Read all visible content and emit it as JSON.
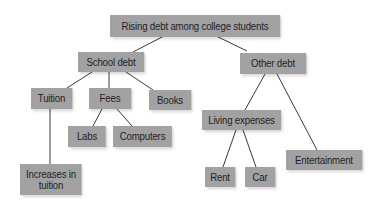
{
  "diagram": {
    "type": "tree",
    "root": "root",
    "nodes": [
      {
        "id": "root",
        "label": "Rising debt among college students",
        "x": 110,
        "y": 15,
        "w": 170,
        "h": 22
      },
      {
        "id": "school_debt",
        "label": "School debt",
        "x": 78,
        "y": 52,
        "w": 66,
        "h": 20
      },
      {
        "id": "other_debt",
        "label": "Other debt",
        "x": 240,
        "y": 53,
        "w": 66,
        "h": 21
      },
      {
        "id": "tuition",
        "label": "Tuition",
        "x": 31,
        "y": 88,
        "w": 41,
        "h": 21
      },
      {
        "id": "fees",
        "label": "Fees",
        "x": 89,
        "y": 88,
        "w": 42,
        "h": 21
      },
      {
        "id": "books",
        "label": "Books",
        "x": 149,
        "y": 90,
        "w": 42,
        "h": 20
      },
      {
        "id": "labs",
        "label": "Labs",
        "x": 68,
        "y": 126,
        "w": 38,
        "h": 21
      },
      {
        "id": "computers",
        "label": "Computers",
        "x": 113,
        "y": 126,
        "w": 59,
        "h": 21
      },
      {
        "id": "increases_in_tuition",
        "label": "Increases in tuition",
        "x": 20,
        "y": 164,
        "w": 62,
        "h": 31
      },
      {
        "id": "living_expenses",
        "label": "Living expenses",
        "x": 202,
        "y": 110,
        "w": 79,
        "h": 20
      },
      {
        "id": "rent",
        "label": "Rent",
        "x": 205,
        "y": 167,
        "w": 30,
        "h": 20
      },
      {
        "id": "car",
        "label": "Car",
        "x": 245,
        "y": 167,
        "w": 30,
        "h": 20
      },
      {
        "id": "entertainment",
        "label": "Entertainment",
        "x": 286,
        "y": 150,
        "w": 76,
        "h": 20
      }
    ],
    "edges": [
      {
        "from": "root",
        "to": "school_debt",
        "x1": 166,
        "y1": 35,
        "x2": 133,
        "y2": 52
      },
      {
        "from": "root",
        "to": "other_debt",
        "x1": 214,
        "y1": 35,
        "x2": 247,
        "y2": 51
      },
      {
        "from": "school_debt",
        "to": "tuition",
        "x1": 92,
        "y1": 72,
        "x2": 67,
        "y2": 88
      },
      {
        "from": "school_debt",
        "to": "fees",
        "x1": 109,
        "y1": 72,
        "x2": 109,
        "y2": 88
      },
      {
        "from": "school_debt",
        "to": "books",
        "x1": 126,
        "y1": 72,
        "x2": 153,
        "y2": 90
      },
      {
        "from": "fees",
        "to": "labs",
        "x1": 102,
        "y1": 109,
        "x2": 93,
        "y2": 126
      },
      {
        "from": "fees",
        "to": "computers",
        "x1": 117,
        "y1": 109,
        "x2": 132,
        "y2": 126
      },
      {
        "from": "tuition",
        "to": "increases_in_tuition",
        "x1": 50,
        "y1": 109,
        "x2": 50,
        "y2": 164
      },
      {
        "from": "other_debt",
        "to": "living_expenses",
        "x1": 265,
        "y1": 74,
        "x2": 245,
        "y2": 110
      },
      {
        "from": "other_debt",
        "to": "entertainment",
        "x1": 277,
        "y1": 74,
        "x2": 317,
        "y2": 150
      },
      {
        "from": "living_expenses",
        "to": "rent",
        "x1": 236,
        "y1": 130,
        "x2": 223,
        "y2": 167
      },
      {
        "from": "living_expenses",
        "to": "car",
        "x1": 243,
        "y1": 130,
        "x2": 256,
        "y2": 167
      }
    ],
    "colors": {
      "node_fill": "#a2a2a2",
      "node_text": "#1f1f1f",
      "edge": "#3a3a3a",
      "background": "#ffffff"
    }
  }
}
